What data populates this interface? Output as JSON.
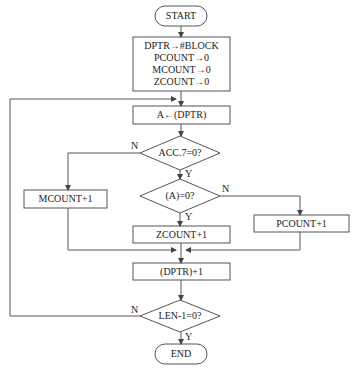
{
  "diagram": {
    "type": "flowchart",
    "nodes": {
      "start": "START",
      "init": [
        "DPTR→#BLOCK",
        "PCOUNT→0",
        "MCOUNT→0",
        "ZCOUNT→0"
      ],
      "load": "A←(DPTR)",
      "acc7": "ACC.7=0?",
      "mcount": "MCOUNT+1",
      "aeq0": "(A)=0?",
      "zcount": "ZCOUNT+1",
      "pcount": "PCOUNT+1",
      "incptr": "(DPTR)+1",
      "lendec": "LEN-1=0?",
      "end": "END"
    },
    "labels": {
      "acc7_no": "N",
      "acc7_yes": "Y",
      "aeq0_no": "N",
      "aeq0_yes": "Y",
      "len_no": "N",
      "len_yes": "Y"
    },
    "colors": {
      "stroke": "#555555",
      "text": "#222222",
      "background": "#ffffff"
    }
  }
}
